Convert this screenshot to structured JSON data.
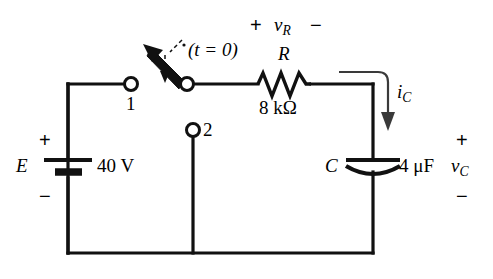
{
  "figure": {
    "type": "circuit-schematic"
  },
  "source": {
    "symbol": "E",
    "value": "40 V",
    "polarity_top": "+",
    "polarity_bottom": "−"
  },
  "switch": {
    "label": "(t = 0)",
    "position_1_label": "1",
    "position_2_label": "2"
  },
  "resistor": {
    "symbol": "R",
    "value": "8 kΩ",
    "voltage_label": "v",
    "voltage_subscript": "R",
    "polarity_left": "+",
    "polarity_right": "−"
  },
  "capacitor": {
    "symbol": "C",
    "value": "4 μF",
    "voltage_label": "v",
    "voltage_subscript": "C",
    "polarity_top": "+",
    "polarity_bottom": "−"
  },
  "current": {
    "label": "i",
    "subscript": "C"
  },
  "colors": {
    "wire": "#111111",
    "background": "#ffffff",
    "text": "#000000"
  }
}
